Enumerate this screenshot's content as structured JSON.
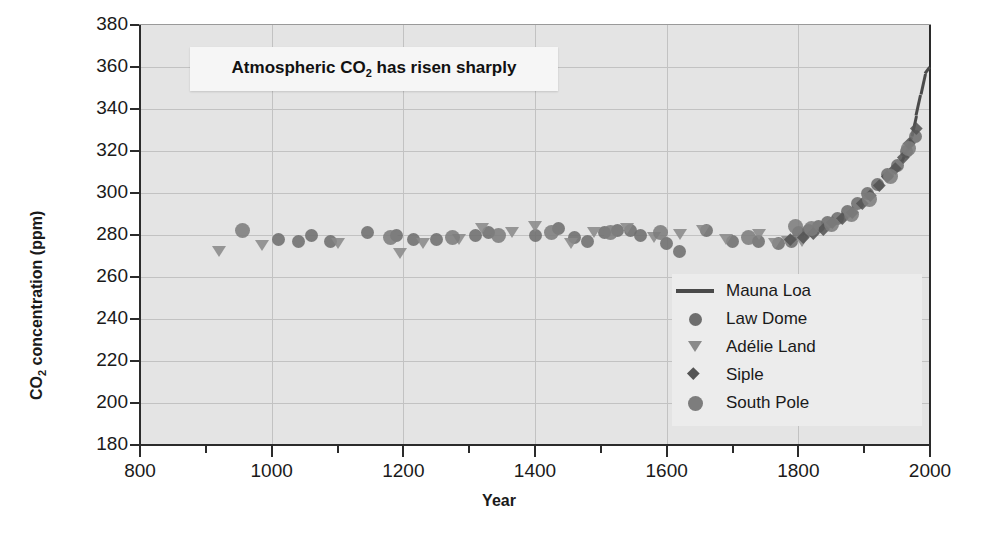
{
  "callout": {
    "prefix": "Atmospheric CO",
    "sub": "2",
    "suffix": " has risen sharply"
  },
  "axis": {
    "y_title_prefix": "CO",
    "y_title_sub": "2",
    "y_title_suffix": " concentration (ppm)",
    "x_title": "Year"
  },
  "legend": {
    "items": [
      {
        "label": "Mauna Loa",
        "marker": "line",
        "color": "#4a4a4a",
        "size": 0
      },
      {
        "label": "Law Dome",
        "marker": "circle",
        "color": "#6e6e6e",
        "size": 13
      },
      {
        "label": "Adélie Land",
        "marker": "triangle-down",
        "color": "#8a8a8a",
        "size": 14
      },
      {
        "label": "Siple",
        "marker": "diamond",
        "color": "#545454",
        "size": 12
      },
      {
        "label": "South Pole",
        "marker": "circle",
        "color": "#7d7d7d",
        "size": 15
      }
    ]
  },
  "chart_data": {
    "type": "scatter",
    "title": "Atmospheric CO2 has risen sharply",
    "xlabel": "Year",
    "ylabel": "CO2 concentration (ppm)",
    "xlim": [
      800,
      2000
    ],
    "ylim": [
      180,
      380
    ],
    "xticks": [
      800,
      1000,
      1200,
      1400,
      1600,
      1800,
      2000
    ],
    "xticks_minor": [
      900,
      1100,
      1300,
      1500,
      1700,
      1900
    ],
    "yticks": [
      180,
      200,
      220,
      240,
      260,
      280,
      300,
      320,
      340,
      360,
      380
    ],
    "grid": "both",
    "legend_position": "lower-right-inside",
    "series": [
      {
        "name": "Mauna Loa",
        "marker": "line",
        "color": "#4a4a4a",
        "points": [
          [
            1958,
            315
          ],
          [
            1965,
            320
          ],
          [
            1972,
            327
          ],
          [
            1979,
            337
          ],
          [
            1986,
            347
          ],
          [
            1993,
            357
          ],
          [
            2000,
            360
          ]
        ]
      },
      {
        "name": "Law Dome",
        "marker": "circle",
        "color": "#6e6e6e",
        "points": [
          [
            1010,
            278
          ],
          [
            1040,
            277
          ],
          [
            1060,
            280
          ],
          [
            1090,
            277
          ],
          [
            1145,
            281
          ],
          [
            1190,
            280
          ],
          [
            1215,
            278
          ],
          [
            1250,
            278
          ],
          [
            1310,
            280
          ],
          [
            1330,
            281
          ],
          [
            1400,
            280
          ],
          [
            1435,
            283
          ],
          [
            1460,
            279
          ],
          [
            1480,
            277
          ],
          [
            1505,
            281
          ],
          [
            1525,
            282
          ],
          [
            1545,
            282
          ],
          [
            1560,
            280
          ],
          [
            1600,
            276
          ],
          [
            1620,
            272
          ],
          [
            1660,
            282
          ],
          [
            1700,
            277
          ],
          [
            1740,
            277
          ],
          [
            1770,
            276
          ],
          [
            1790,
            277
          ],
          [
            1800,
            281
          ],
          [
            1815,
            282
          ],
          [
            1830,
            284
          ],
          [
            1845,
            286
          ],
          [
            1860,
            288
          ],
          [
            1875,
            291
          ],
          [
            1890,
            295
          ],
          [
            1905,
            300
          ],
          [
            1920,
            304
          ],
          [
            1935,
            309
          ],
          [
            1950,
            313
          ],
          [
            1965,
            320
          ],
          [
            1978,
            327
          ]
        ]
      },
      {
        "name": "Adélie Land",
        "marker": "triangle-down",
        "color": "#8a8a8a",
        "points": [
          [
            920,
            272
          ],
          [
            985,
            275
          ],
          [
            1100,
            276
          ],
          [
            1195,
            271
          ],
          [
            1230,
            276
          ],
          [
            1285,
            278
          ],
          [
            1320,
            283
          ],
          [
            1365,
            281
          ],
          [
            1400,
            284
          ],
          [
            1455,
            276
          ],
          [
            1490,
            281
          ],
          [
            1540,
            283
          ],
          [
            1580,
            279
          ],
          [
            1620,
            280
          ],
          [
            1655,
            282
          ],
          [
            1690,
            278
          ],
          [
            1740,
            280
          ],
          [
            1765,
            276
          ],
          [
            1785,
            277
          ],
          [
            1805,
            277
          ]
        ]
      },
      {
        "name": "Siple",
        "marker": "diamond",
        "color": "#545454",
        "points": [
          [
            1790,
            277
          ],
          [
            1810,
            278
          ],
          [
            1825,
            280
          ],
          [
            1840,
            282
          ],
          [
            1855,
            285
          ],
          [
            1870,
            287
          ],
          [
            1885,
            290
          ],
          [
            1900,
            294
          ],
          [
            1912,
            298
          ],
          [
            1925,
            303
          ],
          [
            1938,
            307
          ],
          [
            1950,
            311
          ],
          [
            1962,
            316
          ],
          [
            1972,
            323
          ],
          [
            1982,
            330
          ]
        ]
      },
      {
        "name": "South Pole",
        "marker": "circle",
        "color": "#7d7d7d",
        "points": [
          [
            955,
            282
          ],
          [
            1180,
            279
          ],
          [
            1275,
            279
          ],
          [
            1345,
            280
          ],
          [
            1425,
            281
          ],
          [
            1515,
            281
          ],
          [
            1590,
            281
          ],
          [
            1725,
            279
          ],
          [
            1795,
            284
          ],
          [
            1820,
            283
          ],
          [
            1850,
            285
          ],
          [
            1880,
            290
          ],
          [
            1908,
            297
          ],
          [
            1940,
            308
          ],
          [
            1968,
            321
          ]
        ]
      }
    ]
  }
}
